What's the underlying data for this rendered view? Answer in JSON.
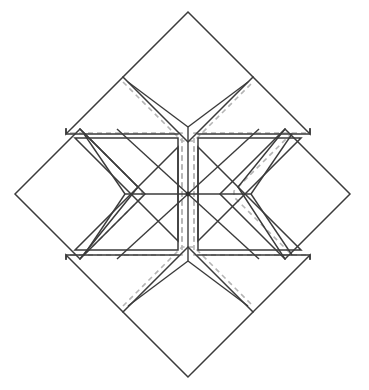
{
  "figure": {
    "background_color": "#ffffff",
    "line_color": "#3b3b3b",
    "dashed_line_color": "#b4b4b4",
    "fill_color": "#ffffff",
    "canvas": {
      "width": 369,
      "height": 390
    }
  },
  "geometry": {
    "center": {
      "x": 188,
      "y": 194
    },
    "block_diagonal_half_width": 173,
    "block_diagonal_half_height": 182,
    "star_arm_tip_radius": 63,
    "star_point_outer_radius": 100,
    "notch_apex_radius": 67,
    "seam_offset": 6,
    "outer_vertices": {
      "top": {
        "x": 188,
        "y": 12
      },
      "right": {
        "x": 350,
        "y": 194
      },
      "bottom": {
        "x": 188,
        "y": 377
      },
      "left": {
        "x": 15,
        "y": 194
      }
    }
  },
  "pieces": {
    "corner_squares": [
      {
        "name": "square-top",
        "position": "top",
        "has_seam_allowance": false
      },
      {
        "name": "square-right",
        "position": "right",
        "has_seam_allowance": false
      },
      {
        "name": "square-bottom",
        "position": "bottom",
        "has_seam_allowance": false
      },
      {
        "name": "square-left",
        "position": "left",
        "has_seam_allowance": false
      }
    ],
    "side_triangles": [
      {
        "name": "triangle-top-left",
        "position": "top-left",
        "has_seam_allowance": true
      },
      {
        "name": "triangle-top-right",
        "position": "top-right",
        "has_seam_allowance": true
      },
      {
        "name": "triangle-bottom-right",
        "position": "bottom-right",
        "has_seam_allowance": true
      },
      {
        "name": "triangle-bottom-left",
        "position": "bottom-left",
        "has_seam_allowance": true
      }
    ],
    "star_diamonds": [
      {
        "name": "diamond-n",
        "angle_deg": 270
      },
      {
        "name": "diamond-ne",
        "angle_deg": 315
      },
      {
        "name": "diamond-e",
        "angle_deg": 0
      },
      {
        "name": "diamond-se",
        "angle_deg": 45
      },
      {
        "name": "diamond-s",
        "angle_deg": 90
      },
      {
        "name": "diamond-sw",
        "angle_deg": 135
      },
      {
        "name": "diamond-w",
        "angle_deg": 180
      },
      {
        "name": "diamond-nw",
        "angle_deg": 225
      }
    ]
  },
  "chart_data": {
    "type": "diagram",
    "piece_counts": {
      "corner_squares": 4,
      "side_triangles": 4,
      "star_diamonds": 8,
      "total_pieces": 16
    },
    "stroke_styles": [
      {
        "name": "cut-line",
        "style": "solid",
        "color": "#3b3b3b",
        "width": 1.5
      },
      {
        "name": "seam-allowance-line",
        "style": "dashed",
        "color": "#b4b4b4",
        "width": 1.6
      }
    ]
  }
}
